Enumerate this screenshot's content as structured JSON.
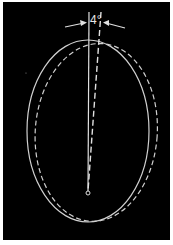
{
  "diagram": {
    "angle_label": "4°",
    "colors": {
      "background": "#000000",
      "stroke": "#d8d8d8",
      "border": "#ffffff"
    },
    "solid_ellipse": {
      "cx": 88,
      "cy": 131,
      "rx": 61,
      "ry": 91
    },
    "rotation_degrees": 4,
    "pivot": {
      "x": 88,
      "y": 193
    }
  }
}
